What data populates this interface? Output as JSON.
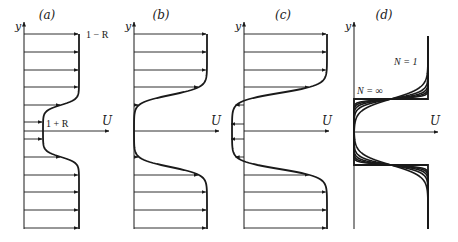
{
  "figure": {
    "ink": "#1a1a1a",
    "panels": [
      {
        "id": "a",
        "label": "(a)",
        "label_pos": [
          47,
          19
        ],
        "axis_x": 24,
        "axis_top": 22,
        "axis_bottom": 229,
        "u_axis_y": 131,
        "u_axis_end": 109,
        "y_label": "y",
        "y_label_pos": [
          15,
          30
        ],
        "u_label": "U",
        "u_label_pos": [
          102,
          125
        ],
        "annotations": [
          {
            "text": "1 − R",
            "pos": [
              86,
              38
            ]
          },
          {
            "text": "1 + R",
            "pos": [
              46,
              127
            ]
          }
        ],
        "profile": {
          "outer": 79,
          "inner": 43,
          "center": 131,
          "half": 26,
          "width": 17
        },
        "arrow_rows": [
          34,
          52,
          70,
          87,
          105,
          122,
          139,
          157,
          175,
          192,
          210,
          228
        ]
      },
      {
        "id": "b",
        "label": "(b)",
        "label_pos": [
          161,
          19
        ],
        "axis_x": 134,
        "axis_top": 22,
        "axis_bottom": 229,
        "u_axis_y": 131,
        "u_axis_end": 219,
        "y_label": "y",
        "y_label_pos": [
          125,
          30
        ],
        "u_label": "U",
        "u_label_pos": [
          211,
          125
        ],
        "annotations": [],
        "profile": {
          "outer": 207,
          "inner": 134,
          "center": 131,
          "half": 36,
          "width": 23
        },
        "arrow_rows": [
          34,
          52,
          70,
          87,
          105,
          157,
          175,
          192,
          210,
          228
        ]
      },
      {
        "id": "c",
        "label": "(c)",
        "label_pos": [
          283,
          19
        ],
        "axis_x": 244,
        "axis_top": 22,
        "axis_bottom": 229,
        "u_axis_y": 131,
        "u_axis_end": 329,
        "y_label": "y",
        "y_label_pos": [
          235,
          30
        ],
        "u_label": "U",
        "u_label_pos": [
          322,
          125
        ],
        "annotations": [],
        "profile": {
          "outer": 327,
          "inner": 232,
          "center": 131,
          "half": 38,
          "width": 24
        },
        "arrow_rows": [
          34,
          52,
          70,
          87,
          105,
          124,
          139,
          157,
          175,
          192,
          210,
          228
        ]
      },
      {
        "id": "d",
        "label": "(d)",
        "label_pos": [
          384,
          19
        ],
        "axis_x": 354,
        "axis_top": 22,
        "axis_bottom": 229,
        "u_axis_y": 132,
        "u_axis_end": 438,
        "y_label": "y",
        "y_label_pos": [
          345,
          30
        ],
        "u_label": "U",
        "u_label_pos": [
          430,
          125
        ],
        "annotations": [
          {
            "text": "N = 1",
            "pos": [
              394,
              65
            ]
          },
          {
            "text": "N = ∞",
            "pos": [
              357,
              94
            ]
          }
        ],
        "step": {
          "left": 354,
          "right": 428,
          "top": 99,
          "bottom": 165,
          "top_end": 36,
          "bottom_end": 229,
          "cross_x": 390
        },
        "family_N": [
          1,
          2,
          3,
          4,
          6,
          "∞"
        ]
      }
    ]
  }
}
